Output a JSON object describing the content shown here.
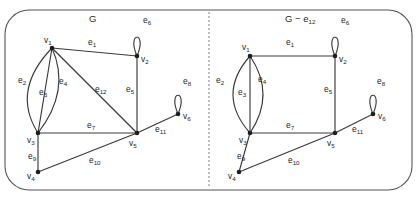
{
  "figure": {
    "width": 417,
    "height": 198,
    "background_color": "#ffffff",
    "frame_color": "#555555",
    "edge_color": "#3a3a3a",
    "vertex_color": "#1d1d1d",
    "label_color": "#1d1d1d",
    "divider_color": "#8a8a8a",
    "divider_style": "dashed"
  },
  "panels": [
    {
      "id": "left",
      "title": "G",
      "title_main": "G",
      "title_sub": "",
      "vertices": [
        {
          "id": "v1",
          "label": "v",
          "sub": "1",
          "x": 52,
          "y": 48,
          "label_x": 44,
          "label_y": 43
        },
        {
          "id": "v2",
          "label": "v",
          "sub": "2",
          "x": 137,
          "y": 56,
          "label_x": 141,
          "label_y": 62
        },
        {
          "id": "v3",
          "label": "v",
          "sub": "3",
          "x": 38,
          "y": 133,
          "label_x": 27,
          "label_y": 143
        },
        {
          "id": "v4",
          "label": "v",
          "sub": "4",
          "x": 38,
          "y": 172,
          "label_x": 27,
          "label_y": 179
        },
        {
          "id": "v5",
          "label": "v",
          "sub": "5",
          "x": 137,
          "y": 133,
          "label_x": 129,
          "label_y": 146
        },
        {
          "id": "v6",
          "label": "v",
          "sub": "6",
          "x": 178,
          "y": 114,
          "label_x": 183,
          "label_y": 119
        }
      ],
      "edges": [
        {
          "id": "e1",
          "label": "e",
          "sub": "1",
          "from": "v1",
          "to": "v2",
          "kind": "line",
          "label_x": 88,
          "label_y": 45
        },
        {
          "id": "e2",
          "label": "e",
          "sub": "2",
          "from": "v1",
          "to": "v3",
          "kind": "arc-left",
          "bulge": 17,
          "label_x": 18,
          "label_y": 83
        },
        {
          "id": "e3",
          "label": "e",
          "sub": "3",
          "from": "v1",
          "to": "v3",
          "kind": "line",
          "label_x": 39,
          "label_y": 95
        },
        {
          "id": "e4",
          "label": "e",
          "sub": "4",
          "from": "v1",
          "to": "v3",
          "kind": "arc-right",
          "bulge": 13,
          "label_x": 59,
          "label_y": 84
        },
        {
          "id": "e5",
          "label": "e",
          "sub": "5",
          "from": "v2",
          "to": "v5",
          "kind": "line",
          "label_x": 126,
          "label_y": 92
        },
        {
          "id": "e6",
          "label": "e",
          "sub": "6",
          "from": "v2",
          "to": "v2",
          "kind": "loop-up",
          "label_x": 143,
          "label_y": 23
        },
        {
          "id": "e7",
          "label": "e",
          "sub": "7",
          "from": "v3",
          "to": "v5",
          "kind": "line",
          "label_x": 87,
          "label_y": 128
        },
        {
          "id": "e8",
          "label": "e",
          "sub": "8",
          "from": "v6",
          "to": "v6",
          "kind": "loop-up",
          "label_x": 183,
          "label_y": 84
        },
        {
          "id": "e9",
          "label": "e",
          "sub": "9",
          "from": "v3",
          "to": "v4",
          "kind": "line",
          "label_x": 28,
          "label_y": 159
        },
        {
          "id": "e10",
          "label": "e",
          "sub": "10",
          "from": "v4",
          "to": "v5",
          "kind": "line",
          "label_x": 89,
          "label_y": 163
        },
        {
          "id": "e11",
          "label": "e",
          "sub": "11",
          "from": "v5",
          "to": "v6",
          "kind": "line",
          "label_x": 155,
          "label_y": 132
        },
        {
          "id": "e12",
          "label": "e",
          "sub": "12",
          "from": "v1",
          "to": "v5",
          "kind": "line",
          "label_x": 95,
          "label_y": 92
        }
      ]
    },
    {
      "id": "right",
      "title": "G − e12",
      "title_main": "G − e",
      "title_sub": "12",
      "vertices": [
        {
          "id": "v1",
          "label": "v",
          "sub": "1",
          "x": 250,
          "y": 56,
          "label_x": 242,
          "label_y": 50
        },
        {
          "id": "v2",
          "label": "v",
          "sub": "2",
          "x": 335,
          "y": 56,
          "label_x": 339,
          "label_y": 62
        },
        {
          "id": "v3",
          "label": "v",
          "sub": "3",
          "x": 250,
          "y": 133,
          "label_x": 239,
          "label_y": 143
        },
        {
          "id": "v4",
          "label": "v",
          "sub": "4",
          "x": 239,
          "y": 172,
          "label_x": 228,
          "label_y": 179
        },
        {
          "id": "v5",
          "label": "v",
          "sub": "5",
          "x": 335,
          "y": 133,
          "label_x": 327,
          "label_y": 146
        },
        {
          "id": "v6",
          "label": "v",
          "sub": "6",
          "x": 373,
          "y": 114,
          "label_x": 378,
          "label_y": 119
        }
      ],
      "edges": [
        {
          "id": "e1",
          "label": "e",
          "sub": "1",
          "from": "v1",
          "to": "v2",
          "kind": "line",
          "label_x": 286,
          "label_y": 45
        },
        {
          "id": "e2",
          "label": "e",
          "sub": "2",
          "from": "v1",
          "to": "v3",
          "kind": "arc-left",
          "bulge": 17,
          "label_x": 216,
          "label_y": 83
        },
        {
          "id": "e3",
          "label": "e",
          "sub": "3",
          "from": "v1",
          "to": "v3",
          "kind": "line",
          "label_x": 238,
          "label_y": 95
        },
        {
          "id": "e4",
          "label": "e",
          "sub": "4",
          "from": "v1",
          "to": "v3",
          "kind": "arc-right",
          "bulge": 13,
          "label_x": 258,
          "label_y": 82
        },
        {
          "id": "e5",
          "label": "e",
          "sub": "5",
          "from": "v2",
          "to": "v5",
          "kind": "line",
          "label_x": 324,
          "label_y": 92
        },
        {
          "id": "e6",
          "label": "e",
          "sub": "6",
          "from": "v2",
          "to": "v2",
          "kind": "loop-up",
          "label_x": 341,
          "label_y": 23
        },
        {
          "id": "e7",
          "label": "e",
          "sub": "7",
          "from": "v3",
          "to": "v5",
          "kind": "line",
          "label_x": 286,
          "label_y": 128
        },
        {
          "id": "e8",
          "label": "e",
          "sub": "8",
          "from": "v6",
          "to": "v6",
          "kind": "loop-up",
          "label_x": 377,
          "label_y": 84
        },
        {
          "id": "e9",
          "label": "e",
          "sub": "9",
          "from": "v3",
          "to": "v4",
          "kind": "line",
          "label_x": 237,
          "label_y": 159
        },
        {
          "id": "e10",
          "label": "e",
          "sub": "10",
          "from": "v4",
          "to": "v5",
          "kind": "line",
          "label_x": 288,
          "label_y": 163
        },
        {
          "id": "e11",
          "label": "e",
          "sub": "11",
          "from": "v5",
          "to": "v6",
          "kind": "line",
          "label_x": 352,
          "label_y": 132
        }
      ]
    }
  ],
  "divider": {
    "x": 209,
    "y_top": 12,
    "y_bottom": 188
  },
  "frame": {
    "x": 5,
    "y": 10,
    "width": 407,
    "height": 180,
    "radius": 24
  }
}
